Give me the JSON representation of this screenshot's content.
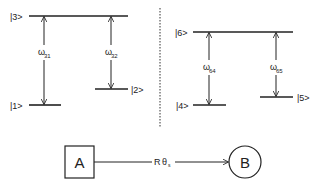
{
  "left_system": {
    "levels": [
      {
        "label": "|3>"
      },
      {
        "label": "|1>"
      },
      {
        "label": "|2>"
      }
    ],
    "transitions": [
      {
        "symbol": "ω",
        "sub": "31"
      },
      {
        "symbol": "ω",
        "sub": "32"
      }
    ]
  },
  "right_system": {
    "levels": [
      {
        "label": "|6>"
      },
      {
        "label": "|4>"
      },
      {
        "label": "|5>"
      }
    ],
    "transitions": [
      {
        "symbol": "ω",
        "sub": "64"
      },
      {
        "symbol": "ω",
        "sub": "65"
      }
    ]
  },
  "transfer": {
    "source": "A",
    "target": "B",
    "rate_symbol": "R",
    "rate_greek": "θ",
    "rate_sub": "s"
  },
  "colors": {
    "ink": "#222222",
    "background": "#ffffff"
  }
}
